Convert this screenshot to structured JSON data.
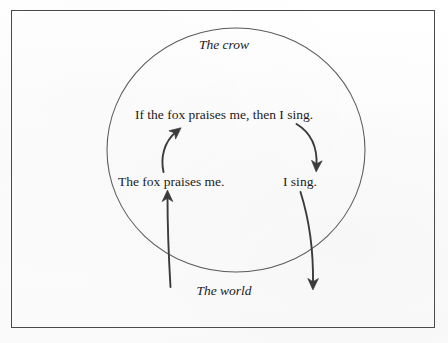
{
  "figure": {
    "type": "diagram",
    "domain_circle": {
      "label": "The crow",
      "style": "italic"
    },
    "outside_label": {
      "label": "The world",
      "style": "italic"
    },
    "propositions": {
      "conditional": "If the fox praises me, then I sing.",
      "antecedent": "The fox praises me.",
      "consequent": "I sing."
    },
    "arrows": [
      {
        "name": "world-to-antecedent",
        "from": "The world",
        "to": "The fox praises me.",
        "direction": "up",
        "crosses_boundary": true
      },
      {
        "name": "antecedent-to-conditional",
        "from": "The fox praises me.",
        "to": "If the fox praises me, then I sing.",
        "direction": "up",
        "crosses_boundary": false
      },
      {
        "name": "conditional-to-consequent",
        "from": "If the fox praises me, then I sing.",
        "to": "I sing.",
        "direction": "down",
        "crosses_boundary": false
      },
      {
        "name": "consequent-to-world",
        "from": "I sing.",
        "to": "The world",
        "direction": "down",
        "crosses_boundary": true
      }
    ],
    "colors": {
      "ink": "#1b1b1b",
      "circle_stroke": "#5a5a5a",
      "frame_stroke": "#4a4a4a",
      "arrow_stroke": "#3b3b3b",
      "background": "#fdfdfd"
    }
  }
}
